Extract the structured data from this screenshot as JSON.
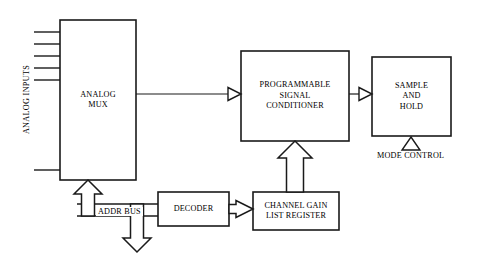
{
  "diagram": {
    "stroke_color": "#1a1a1a",
    "fill_color": "#ffffff",
    "blocks": [
      {
        "id": "analog-mux",
        "label": "ANALOG\nMUX",
        "x": 60,
        "y": 20,
        "w": 76,
        "h": 160
      },
      {
        "id": "programmable-signal-conditioner",
        "label": "PROGRAMMABLE\nSIGNAL\nCONDITIONER",
        "x": 241,
        "y": 51,
        "w": 108,
        "h": 90
      },
      {
        "id": "sample-and-hold",
        "label": "SAMPLE\nAND\nHOLD",
        "x": 372,
        "y": 57,
        "w": 79,
        "h": 79
      },
      {
        "id": "decoder",
        "label": "DECODER",
        "x": 158,
        "y": 192,
        "w": 71,
        "h": 34
      },
      {
        "id": "channel-gain-list-register",
        "label": "CHANNEL GAIN\nLIST REGISTER",
        "x": 253,
        "y": 192,
        "w": 86,
        "h": 38
      }
    ],
    "labels": {
      "analog_inputs": "ANALOG INPUTS",
      "addr_bus": "ADDR BUS",
      "mode_control": "MODE CONTROL"
    },
    "analog_input_count": 6
  }
}
